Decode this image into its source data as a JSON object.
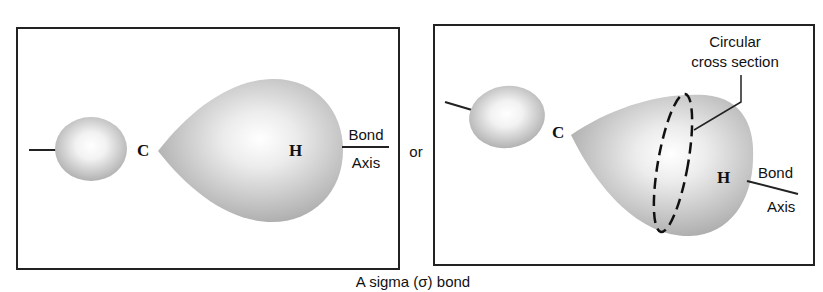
{
  "figure": {
    "caption": "A sigma (σ) bond",
    "connector": "or",
    "left_panel": {
      "atom_c": "C",
      "atom_h": "H",
      "axis_label_top": "Bond",
      "axis_label_bottom": "Axis"
    },
    "right_panel": {
      "atom_c": "C",
      "atom_h": "H",
      "axis_label_top": "Bond",
      "axis_label_bottom": "Axis",
      "callout_line1": "Circular",
      "callout_line2": "cross section"
    }
  }
}
